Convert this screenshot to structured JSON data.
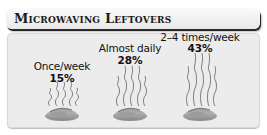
{
  "header": {
    "title": "Microwaving Leftovers"
  },
  "items": [
    {
      "label": "Once/week",
      "value": "15%",
      "center_x": 62,
      "label_y": 60,
      "value_y": 72,
      "steam_top": 82
    },
    {
      "label": "Almost daily",
      "value": "28%",
      "center_x": 130,
      "label_y": 42,
      "value_y": 54,
      "steam_top": 66
    },
    {
      "label": "2–4 times/week",
      "value": "43%",
      "center_x": 200,
      "label_y": 31,
      "value_y": 42,
      "steam_top": 53
    }
  ],
  "colors": {
    "panel_bg": "#ececec",
    "header_bg": "#f3f3f3",
    "bowl": "#9a9a9a",
    "steam": "#6f6f6f",
    "text": "#111111"
  },
  "chart_data": {
    "type": "bar",
    "title": "Microwaving Leftovers",
    "categories": [
      "Once/week",
      "Almost daily",
      "2–4 times/week"
    ],
    "values": [
      15,
      28,
      43
    ],
    "unit": "%",
    "xlabel": "",
    "ylabel": "",
    "note": "Pictograph: steam line height above each bowl is proportional to the percentage",
    "legend": "none",
    "grid": false
  }
}
